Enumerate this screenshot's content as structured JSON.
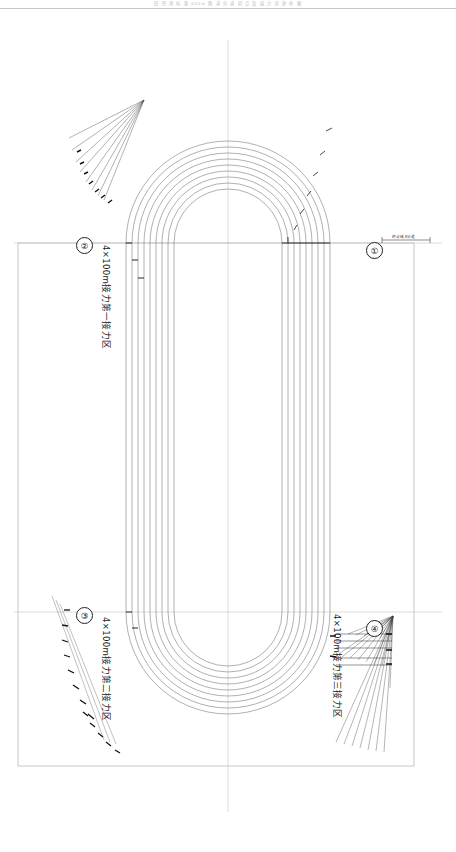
{
  "sheet": {
    "header_text": "田 径 场 标 准 400m 跑 道 分 道 起 点 及 接 力 区 放 样 图",
    "width_px": 456,
    "height_px": 852
  },
  "drawing": {
    "type": "standard-400m-athletics-track-setting-out-plan",
    "lane_count": 8,
    "lane_line_count": 9,
    "ink_color": "#5a5a5a",
    "heavy_color": "#1b1b1b",
    "axis_color": "#aaaaaa"
  },
  "markers": [
    {
      "id": "marker-1",
      "symbol": "①",
      "x": 366,
      "y": 242
    },
    {
      "id": "marker-2",
      "symbol": "②",
      "x": 76,
      "y": 237
    },
    {
      "id": "marker-3",
      "symbol": "③",
      "x": 76,
      "y": 607
    },
    {
      "id": "marker-4",
      "symbol": "④",
      "x": 366,
      "y": 620
    }
  ],
  "zone_labels": [
    {
      "id": "zone-1",
      "text": "4×100m接力第一接力区",
      "x": 113,
      "y": 245,
      "rot": 90
    },
    {
      "id": "zone-2",
      "text": "4×100m接力第二接力区",
      "x": 113,
      "y": 617,
      "rot": 90
    },
    {
      "id": "zone-3",
      "text": "4×100m接力第三接力区",
      "x": 344,
      "y": 614,
      "rot": 90
    }
  ],
  "finish_line": {
    "label": "终点线 8分道",
    "x": 392,
    "y": 236
  },
  "stagger_top_right": {
    "note": "staggered start offsets, lanes 2-8, outer curve top-right",
    "values": [
      "7.352",
      "14.8176",
      "22.4504",
      "30.4443",
      "38.5404",
      "46.1425"
    ]
  },
  "stagger_right_straight": {
    "values": [
      "7.5317"
    ]
  },
  "stagger_top_left": {
    "values": [
      "1.052",
      "3.427",
      "4.855",
      "7.079",
      "9.473",
      "11.696",
      "14.070",
      "16.479"
    ]
  },
  "stagger_left_upper": {
    "values": [
      "2.086",
      "5.908",
      "9.726",
      "13.583",
      "17.306",
      "21.319",
      "11.212",
      "7.386",
      "3.562"
    ]
  },
  "stagger_left_lower": {
    "values": [
      "0.030",
      "1.884",
      "4.505",
      "11.185",
      "8.187",
      "5.343",
      "2.604",
      "4.716",
      "7.128"
    ]
  },
  "stagger_bottom_left": {
    "values": [
      "3.425",
      "6.849",
      "10.274",
      "13.699",
      "17.123",
      "20.548",
      "23.972"
    ]
  },
  "handover_zone_3_dims": {
    "values": [
      "20.000",
      "20.000",
      "20.000",
      "10.000",
      "10.000",
      "10.000"
    ]
  }
}
